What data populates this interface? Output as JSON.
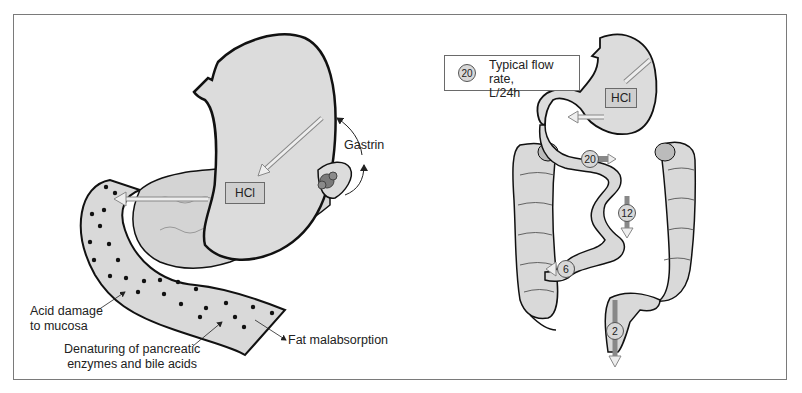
{
  "left_panel": {
    "hcl_label": "HCl",
    "gastrin_label": "Gastrin",
    "annotations": [
      {
        "id": "acid-damage",
        "line1": "Acid damage",
        "line2": "to mucosa"
      },
      {
        "id": "denaturing",
        "line1": "Denaturing of pancreatic",
        "line2": "enzymes and bile acids"
      },
      {
        "id": "fat-malabsorption",
        "line1": "Fat malabsorption"
      }
    ]
  },
  "right_panel": {
    "legend": {
      "badge_value": "20",
      "line1": "Typical flow rate,",
      "line2": "L/24h"
    },
    "hcl_label": "HCl",
    "flow_rates": [
      {
        "location": "duodenum",
        "value": "20"
      },
      {
        "location": "jejunum",
        "value": "12"
      },
      {
        "location": "ileocecal",
        "value": "6"
      },
      {
        "location": "rectum",
        "value": "2"
      }
    ]
  },
  "colors": {
    "organ_fill": "#d9d9d9",
    "outline": "#111111",
    "arrow_fill": "#e4e4e4",
    "hcl_box": "#cfcfcf",
    "gland": "#7a7a7a",
    "frame": "#7a7a7a"
  }
}
